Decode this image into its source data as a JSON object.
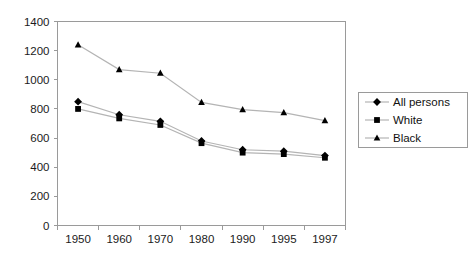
{
  "chart_data": {
    "type": "line",
    "title": "",
    "xlabel": "",
    "ylabel": "",
    "categories": [
      "1950",
      "1960",
      "1970",
      "1980",
      "1990",
      "1995",
      "1997"
    ],
    "ylim": [
      0,
      1400
    ],
    "yticks": [
      0,
      200,
      400,
      600,
      800,
      1000,
      1200,
      1400
    ],
    "ytick_labels": [
      "0",
      "200",
      "400",
      "600",
      "800",
      "1000",
      "1200",
      "1400"
    ],
    "grid": false,
    "legend_position": "right",
    "series": [
      {
        "name": "All persons",
        "marker": "diamond",
        "color": "#000000",
        "values": [
          850,
          760,
          715,
          580,
          520,
          510,
          480
        ]
      },
      {
        "name": "White",
        "marker": "square",
        "color": "#000000",
        "values": [
          800,
          735,
          690,
          565,
          500,
          490,
          465
        ]
      },
      {
        "name": "Black",
        "marker": "triangle",
        "color": "#000000",
        "values": [
          1240,
          1070,
          1045,
          845,
          795,
          775,
          720
        ]
      }
    ]
  },
  "legend": {
    "items": [
      {
        "label": "All persons",
        "marker": "diamond"
      },
      {
        "label": "White",
        "marker": "square"
      },
      {
        "label": "Black",
        "marker": "triangle"
      }
    ]
  },
  "colors": {
    "axis": "#9a9a9a",
    "plot_line": "#b4b4b4",
    "marker": "#000000",
    "text": "#1b1b1b",
    "background": "#ffffff"
  }
}
